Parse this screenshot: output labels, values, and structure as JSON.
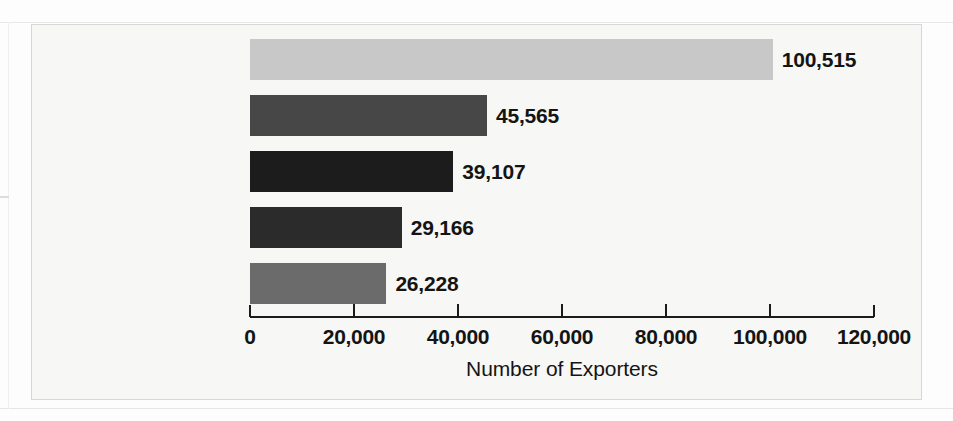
{
  "chart_data": {
    "type": "bar",
    "orientation": "horizontal",
    "title": "",
    "xlabel": "Number of Exporters",
    "ylabel": "",
    "categories": [
      "Canada",
      "Mexico",
      "United Kingdom",
      "Japan",
      "Germany"
    ],
    "values": [
      100515,
      45565,
      39107,
      29166,
      26228
    ],
    "value_labels": [
      "100,515",
      "45,565",
      "39,107",
      "29,166",
      "26,228"
    ],
    "bar_colors": [
      "#c8c8c8",
      "#474747",
      "#1c1c1c",
      "#2b2b2b",
      "#6b6b6b"
    ],
    "xlim": [
      0,
      120000
    ],
    "xticks": [
      0,
      20000,
      40000,
      60000,
      80000,
      100000,
      120000
    ],
    "xtick_labels": [
      "0",
      "20,000",
      "40,000",
      "60,000",
      "80,000",
      "100,000",
      "120,000"
    ],
    "grid": false,
    "legend": null,
    "axis_color": "#1b1b1b",
    "background_color": "#f7f7f5",
    "border_color": "#d7d7d7"
  },
  "bars": [
    {
      "category": "Canada",
      "value": 100515,
      "value_label": "100,515",
      "color": "#c8c8c8"
    },
    {
      "category": "Mexico",
      "value": 45565,
      "value_label": "45,565",
      "color": "#474747"
    },
    {
      "category": "United Kingdom",
      "value": 39107,
      "value_label": "39,107",
      "color": "#1c1c1c"
    },
    {
      "category": "Japan",
      "value": 29166,
      "value_label": "29,166",
      "color": "#2b2b2b"
    },
    {
      "category": "Germany",
      "value": 26228,
      "value_label": "26,228",
      "color": "#6b6b6b"
    }
  ],
  "axis": {
    "title": "Number of Exporters",
    "ticks": [
      "0",
      "20,000",
      "40,000",
      "60,000",
      "80,000",
      "100,000",
      "120,000"
    ]
  }
}
